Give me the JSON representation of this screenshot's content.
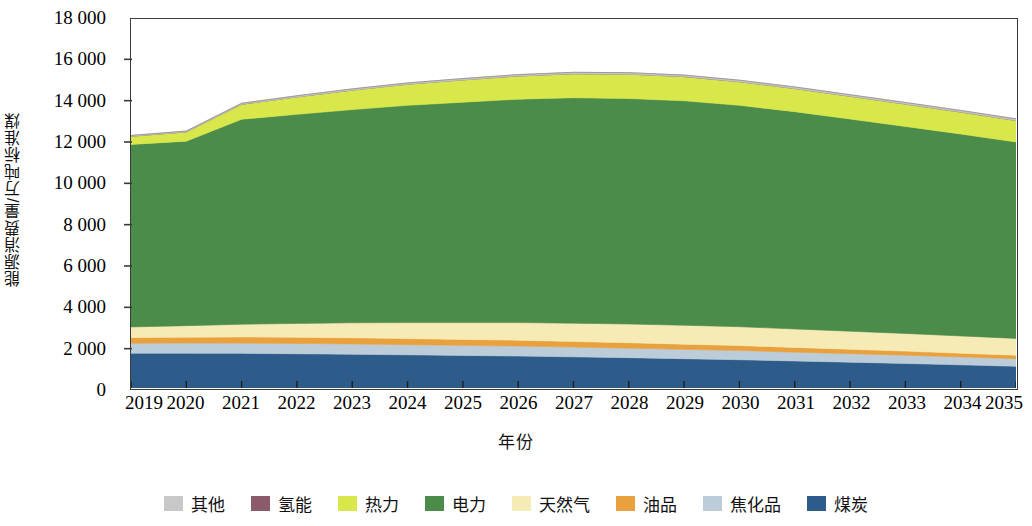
{
  "chart_data": {
    "type": "area",
    "stacked": true,
    "title": "",
    "xlabel": "年份",
    "ylabel": "能源消费量/万吨标准煤",
    "x": [
      2019,
      2020,
      2021,
      2022,
      2023,
      2024,
      2025,
      2026,
      2027,
      2028,
      2029,
      2030,
      2031,
      2032,
      2033,
      2034,
      2035
    ],
    "categories": [
      "2019",
      "2020",
      "2021",
      "2022",
      "2023",
      "2024",
      "2025",
      "2026",
      "2027",
      "2028",
      "2029",
      "2030",
      "2031",
      "2032",
      "2033",
      "2034",
      "2035"
    ],
    "xlim": [
      2019,
      2035
    ],
    "ylim": [
      0,
      18000
    ],
    "yticks": [
      0,
      2000,
      4000,
      6000,
      8000,
      10000,
      12000,
      14000,
      16000,
      18000
    ],
    "ytick_labels": [
      "0",
      "2 000",
      "4 000",
      "6 000",
      "8 000",
      "10 000",
      "12 000",
      "14 000",
      "16 000",
      "18 000"
    ],
    "grid": false,
    "legend_position": "bottom",
    "stack_order_bottom_to_top": [
      "煤炭",
      "焦化品",
      "油品",
      "天然气",
      "电力",
      "热力",
      "氢能",
      "其他"
    ],
    "series": [
      {
        "name": "煤炭",
        "color": "#2E5C8A",
        "values": [
          1700,
          1700,
          1690,
          1670,
          1650,
          1620,
          1590,
          1560,
          1520,
          1480,
          1430,
          1380,
          1320,
          1260,
          1200,
          1130,
          1060
        ]
      },
      {
        "name": "焦化品",
        "color": "#BCCDD9",
        "values": [
          480,
          490,
          500,
          500,
          500,
          495,
          490,
          485,
          475,
          465,
          455,
          445,
          430,
          415,
          400,
          385,
          370
        ]
      },
      {
        "name": "油品",
        "color": "#E9A13E",
        "values": [
          280,
          290,
          300,
          300,
          300,
          295,
          290,
          285,
          275,
          265,
          255,
          245,
          230,
          215,
          200,
          185,
          170
        ]
      },
      {
        "name": "天然气",
        "color": "#F7EBB5",
        "values": [
          520,
          560,
          620,
          680,
          730,
          780,
          820,
          860,
          890,
          910,
          920,
          920,
          900,
          880,
          860,
          840,
          820
        ]
      },
      {
        "name": "电力",
        "color": "#4C8C4A",
        "values": [
          8900,
          9000,
          10000,
          10200,
          10400,
          10600,
          10750,
          10900,
          11000,
          11000,
          10950,
          10800,
          10600,
          10350,
          10100,
          9850,
          9580
        ]
      },
      {
        "name": "热力",
        "color": "#D8E84A",
        "values": [
          400,
          450,
          730,
          850,
          950,
          1030,
          1090,
          1130,
          1170,
          1190,
          1180,
          1150,
          1130,
          1110,
          1090,
          1070,
          1050
        ]
      },
      {
        "name": "氢能",
        "color": "#8B5A6B",
        "values": [
          0,
          0,
          0,
          0,
          0,
          0,
          0,
          0,
          0,
          0,
          0,
          0,
          0,
          0,
          0,
          0,
          0
        ]
      },
      {
        "name": "其他",
        "color": "#C8C8C8",
        "values": [
          40,
          45,
          50,
          55,
          60,
          62,
          65,
          68,
          70,
          72,
          74,
          75,
          76,
          77,
          78,
          79,
          80
        ]
      }
    ],
    "totals": [
      12320,
      12535,
      13890,
      14255,
      14590,
      14882,
      15095,
      15288,
      15400,
      15382,
      15264,
      15015,
      14686,
      14307,
      13928,
      13539,
      13130
    ]
  },
  "legend": {
    "items": [
      {
        "label": "其他",
        "color": "#C8C8C8"
      },
      {
        "label": "氢能",
        "color": "#8B5A6B"
      },
      {
        "label": "热力",
        "color": "#D8E84A"
      },
      {
        "label": "电力",
        "color": "#4C8C4A"
      },
      {
        "label": "天然气",
        "color": "#F7EBB5"
      },
      {
        "label": "油品",
        "color": "#E9A13E"
      },
      {
        "label": "焦化品",
        "color": "#BCCDD9"
      },
      {
        "label": "煤炭",
        "color": "#2E5C8A"
      }
    ]
  },
  "axes": {
    "y_title": "能源消费量/万吨标准煤",
    "x_title": "年份"
  }
}
